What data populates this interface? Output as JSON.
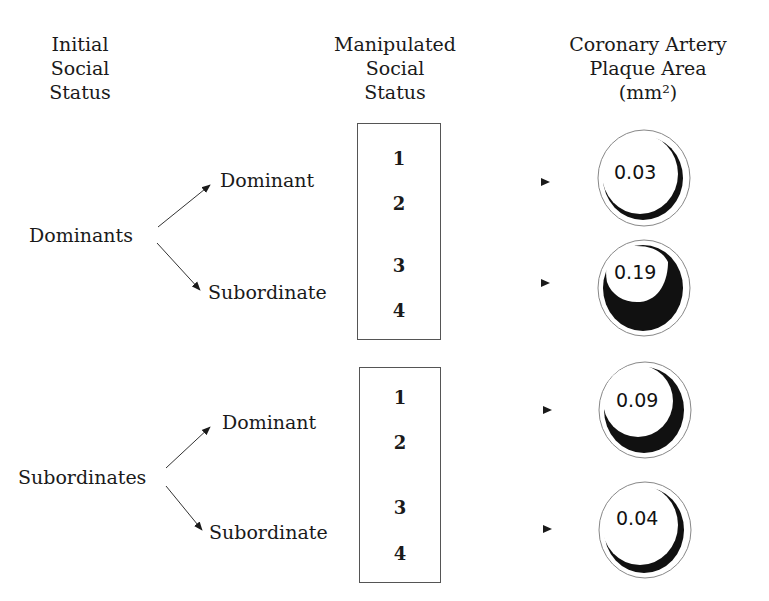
{
  "headers": {
    "initial": [
      "Initial",
      "Social",
      "Status"
    ],
    "manipulated": [
      "Manipulated",
      "Social",
      "Status"
    ],
    "plaque": [
      "Coronary Artery",
      "Plaque Area",
      "(mm²)"
    ]
  },
  "groups": [
    {
      "initial_label": "Dominants",
      "branches": [
        {
          "label": "Dominant",
          "weeks": [
            "1",
            "2"
          ],
          "plaque_area": "0.03"
        },
        {
          "label": "Subordinate",
          "weeks": [
            "3",
            "4"
          ],
          "plaque_area": "0.19"
        }
      ]
    },
    {
      "initial_label": "Subordinates",
      "branches": [
        {
          "label": "Dominant",
          "weeks": [
            "1",
            "2"
          ],
          "plaque_area": "0.09"
        },
        {
          "label": "Subordinate",
          "weeks": [
            "3",
            "4"
          ],
          "plaque_area": "0.04"
        }
      ]
    }
  ],
  "colors": {
    "ink": "#1a1a1a",
    "plaque_fill": "#111111",
    "background": "#ffffff"
  }
}
